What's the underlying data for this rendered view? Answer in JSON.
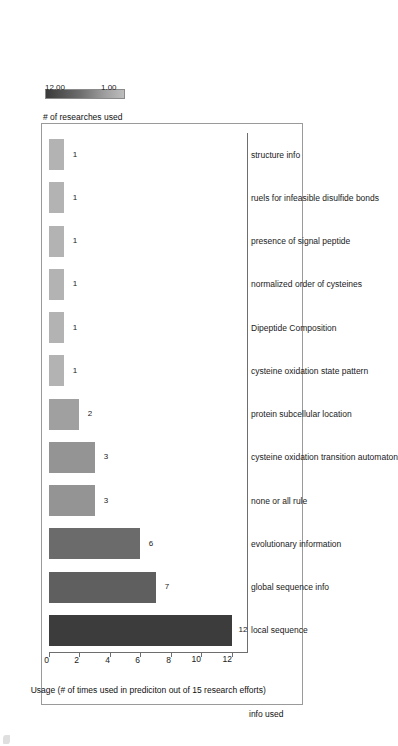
{
  "chart_data": {
    "type": "bar",
    "orientation": "horizontal",
    "title": "",
    "subtitle": "",
    "xlabel": "info used",
    "ylabel": "Usage (# of times used in prediciton out of 15 research efforts)",
    "categories": [
      "local sequence",
      "global sequence info",
      "evolutionary information",
      "none or all rule",
      "cysteine oxidation transition automaton",
      "protein subcellular location",
      "cysteine oxidation state pattern",
      "Dipeptide Composition",
      "normalized order of cysteines",
      "presence of signal peptide",
      "ruels for infeasible disulfide bonds",
      "structure info"
    ],
    "values": [
      12,
      7,
      6,
      3,
      3,
      2,
      1,
      1,
      1,
      1,
      1,
      1
    ],
    "bar_labels": [
      "12",
      "7",
      "6",
      "3",
      "3",
      "2",
      "1",
      "1",
      "1",
      "1",
      "1",
      "1"
    ],
    "bar_colors": [
      "#3c3c3c",
      "#5f5f5f",
      "#6b6b6b",
      "#949494",
      "#949494",
      "#a0a0a0",
      "#b3b3b3",
      "#b3b3b3",
      "#b3b3b3",
      "#b3b3b3",
      "#b3b3b3",
      "#b3b3b3"
    ],
    "ylim": [
      0,
      13
    ],
    "yticks": [
      0,
      2,
      4,
      6,
      8,
      10,
      12
    ],
    "ytick_labels": [
      "0",
      "2",
      "4",
      "6",
      "8",
      "10",
      "12"
    ],
    "grid": false,
    "legend_position": "right"
  },
  "axes": {
    "value_axis_title": "Usage (# of times used in prediciton out of 15 research efforts)",
    "category_axis_title": "info used"
  },
  "legend": {
    "title": "# of researches used",
    "min_label": "1.00",
    "max_label": "12.00",
    "gradient_low_color": "#bdbdbd",
    "gradient_high_color": "#3a3a3a"
  }
}
